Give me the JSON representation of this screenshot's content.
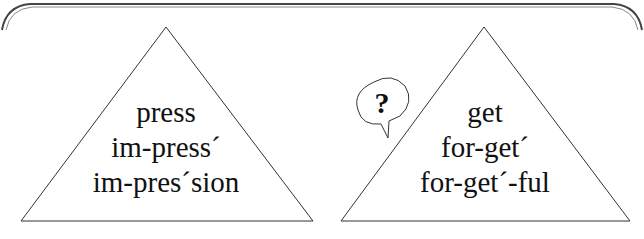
{
  "diagram": {
    "left_triangle": {
      "words": [
        "press",
        "im-press´",
        "im-pres´sion"
      ]
    },
    "right_triangle": {
      "words": [
        "get",
        "for-get´",
        "for-get´-ful"
      ]
    },
    "speech_bubble": {
      "text": "?"
    },
    "colors": {
      "line": "#333333",
      "text": "#111111",
      "background": "#ffffff"
    }
  }
}
